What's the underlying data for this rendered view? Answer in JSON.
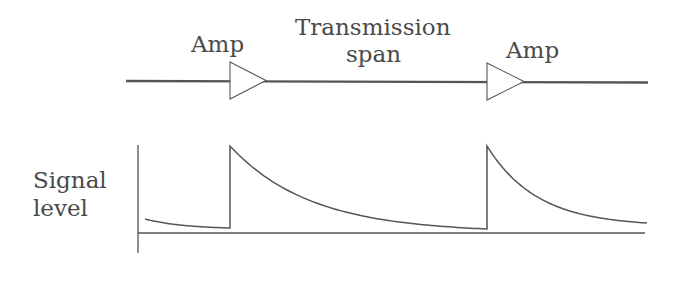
{
  "diagram": {
    "type": "optical transmission link with periodic amplification",
    "colors": {
      "line": "#555555",
      "text": "#4a4a4a",
      "background": "#ffffff"
    },
    "top_row": {
      "labels": {
        "amp_1": "Amp",
        "span_line_1": "Transmission",
        "span_line_2": "span",
        "amp_2": "Amp"
      },
      "fiber_line": {
        "x_start": 126,
        "x_end": 648,
        "y": 81
      },
      "amplifiers": [
        {
          "name": "Amp",
          "x_left": 230,
          "y_top": 62,
          "y_bottom": 99,
          "x_tip": 266
        },
        {
          "name": "Amp",
          "x_left": 487,
          "y_top": 63,
          "y_bottom": 100,
          "x_tip": 524
        }
      ]
    },
    "bottom_plot": {
      "ylabel_line_1": "Signal",
      "ylabel_line_2": "level",
      "axes": {
        "y_axis_x": 138,
        "y_axis_top": 145,
        "y_axis_bottom": 253,
        "x_axis_y": 233,
        "x_axis_left": 138,
        "x_axis_right": 645
      },
      "segments": [
        {
          "x_start": 145,
          "x_end": 230,
          "y_peak_at_start": 219,
          "y_end": 228,
          "jump_to": 146
        },
        {
          "x_start": 230,
          "x_end": 487,
          "y_peak_at_start": 146,
          "y_end": 229,
          "jump_to": 146
        },
        {
          "x_start": 487,
          "x_end": 647,
          "y_peak_at_start": 146,
          "y_end": 223
        }
      ],
      "curve_shape": "exponential decay after each amplifier"
    }
  }
}
